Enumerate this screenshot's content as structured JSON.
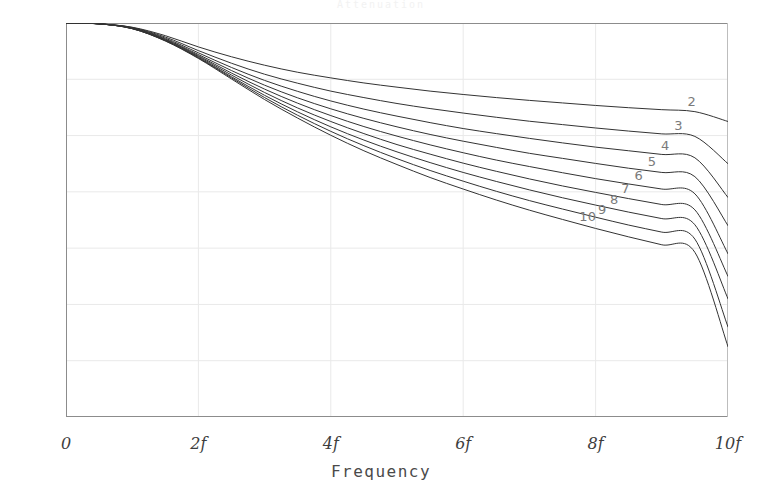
{
  "title_strip": "Attenuation",
  "axes": {
    "y_unit": "[dB]",
    "y_ticks": [
      "0",
      "-10",
      "-20",
      "-30",
      "-40",
      "-50",
      "-60",
      "-70",
      "-80",
      "-90",
      "-100",
      "-110",
      "-120",
      "-130",
      "-140"
    ],
    "x_ticks": [
      "0",
      "2f",
      "4f",
      "6f",
      "8f",
      "10f"
    ],
    "x_title": "Frequency"
  },
  "curve_labels": [
    "2",
    "3",
    "4",
    "5",
    "6",
    "7",
    "8",
    "9",
    "10"
  ],
  "colors": {
    "curve": "#333333",
    "grid": "#e9e9e9",
    "axis": "#8c8c8c",
    "label": "#7a7a7a",
    "text": "#4a4a4a",
    "background": "#ffffff"
  },
  "chart_data": {
    "type": "line",
    "title": "Attenuation",
    "xlabel": "Frequency",
    "ylabel": "[dB]",
    "xlim": [
      0,
      10
    ],
    "ylim": [
      -140,
      0
    ],
    "xtick_values": [
      0,
      2,
      4,
      6,
      8,
      10
    ],
    "xtick_labels": [
      "0",
      "2f",
      "4f",
      "6f",
      "8f",
      "10f"
    ],
    "ytick_values": [
      0,
      -10,
      -20,
      -30,
      -40,
      -50,
      -60,
      -70,
      -80,
      -90,
      -100,
      -110,
      -120,
      -130,
      -140
    ],
    "grid": true,
    "legend": "inline-right-end-labels",
    "x": [
      0,
      0.5,
      1,
      1.5,
      2,
      2.5,
      3,
      3.5,
      4,
      4.5,
      5,
      5.5,
      6,
      6.5,
      7,
      7.5,
      8,
      8.5,
      9,
      9.5,
      10
    ],
    "series": [
      {
        "name": "2",
        "label": "2",
        "values": [
          0.0,
          -0.3,
          -1.5,
          -4.5,
          -8.5,
          -12.0,
          -15.0,
          -17.5,
          -19.5,
          -21.3,
          -22.8,
          -24.2,
          -25.4,
          -26.5,
          -27.5,
          -28.4,
          -29.3,
          -30.1,
          -30.8,
          -31.5,
          -35.0
        ]
      },
      {
        "name": "3",
        "label": "3",
        "values": [
          0.0,
          -0.3,
          -1.6,
          -5.0,
          -9.8,
          -14.3,
          -18.2,
          -21.4,
          -24.2,
          -26.5,
          -28.6,
          -30.4,
          -32.0,
          -33.5,
          -34.9,
          -36.1,
          -37.3,
          -38.4,
          -39.4,
          -40.3,
          -50.0
        ]
      },
      {
        "name": "4",
        "label": "4",
        "values": [
          0.0,
          -0.3,
          -1.7,
          -5.4,
          -10.6,
          -15.8,
          -20.4,
          -24.3,
          -27.7,
          -30.6,
          -33.1,
          -35.4,
          -37.5,
          -39.3,
          -41.0,
          -42.6,
          -44.1,
          -45.4,
          -46.7,
          -47.9,
          -62.0
        ]
      },
      {
        "name": "5",
        "label": "5",
        "values": [
          0.0,
          -0.3,
          -1.8,
          -5.7,
          -11.2,
          -16.9,
          -22.1,
          -26.6,
          -30.5,
          -33.9,
          -36.9,
          -39.6,
          -42.0,
          -44.2,
          -46.3,
          -48.1,
          -49.9,
          -51.6,
          -53.1,
          -54.6,
          -72.0
        ]
      },
      {
        "name": "6",
        "label": "6",
        "values": [
          0.0,
          -0.3,
          -1.9,
          -5.9,
          -11.6,
          -17.8,
          -23.5,
          -28.5,
          -32.9,
          -36.8,
          -40.2,
          -43.3,
          -46.1,
          -48.7,
          -51.0,
          -53.2,
          -55.3,
          -57.2,
          -59.0,
          -60.7,
          -82.0
        ]
      },
      {
        "name": "7",
        "label": "7",
        "values": [
          0.0,
          -0.3,
          -1.9,
          -6.1,
          -11.9,
          -18.5,
          -24.7,
          -30.2,
          -35.0,
          -39.3,
          -43.2,
          -46.6,
          -49.8,
          -52.7,
          -55.4,
          -57.9,
          -60.2,
          -62.4,
          -64.5,
          -66.4,
          -90.0
        ]
      },
      {
        "name": "8",
        "label": "8",
        "values": [
          0.0,
          -0.3,
          -2.0,
          -6.2,
          -12.2,
          -19.1,
          -25.7,
          -31.6,
          -36.9,
          -41.6,
          -45.8,
          -49.6,
          -53.1,
          -56.3,
          -59.3,
          -62.1,
          -64.7,
          -67.2,
          -69.5,
          -71.7,
          -98.0
        ]
      },
      {
        "name": "9",
        "label": "9",
        "values": [
          0.0,
          -0.3,
          -2.0,
          -6.3,
          -12.4,
          -19.5,
          -26.5,
          -32.8,
          -38.5,
          -43.6,
          -48.2,
          -52.4,
          -56.2,
          -59.8,
          -63.1,
          -66.1,
          -69.0,
          -71.8,
          -74.3,
          -76.8,
          -108.0
        ]
      },
      {
        "name": "10",
        "label": "10",
        "values": [
          0.0,
          -0.3,
          -2.0,
          -6.4,
          -12.6,
          -19.9,
          -27.2,
          -33.8,
          -39.9,
          -45.4,
          -50.3,
          -54.9,
          -59.0,
          -62.9,
          -66.5,
          -69.8,
          -73.0,
          -76.0,
          -78.8,
          -81.5,
          -115.0
        ]
      }
    ]
  }
}
